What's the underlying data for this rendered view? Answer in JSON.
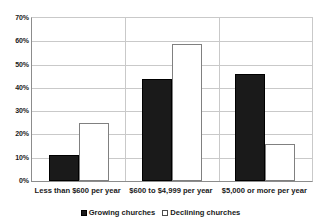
{
  "chart_data": {
    "type": "bar",
    "title": "",
    "subtitle": "",
    "xlabel": "",
    "ylabel": "",
    "categories": [
      "Less than $600 per year",
      "$600 to $4,999 per year",
      "$5,000 or more per year"
    ],
    "series": [
      {
        "name": "Growing churches",
        "color": "#1a1a1a",
        "values": [
          11,
          44,
          46
        ]
      },
      {
        "name": "Declining churches",
        "color": "#ffffff",
        "values": [
          25,
          59,
          16
        ]
      }
    ],
    "ylim": [
      0,
      70
    ],
    "ytick_values": [
      0,
      10,
      20,
      30,
      40,
      50,
      60,
      70
    ],
    "ytick_labels": [
      "0%",
      "10%",
      "20%",
      "30%",
      "40%",
      "50%",
      "60%",
      "70%"
    ],
    "grid": "horizontal",
    "legend_position": "bottom",
    "value_format": "percent"
  },
  "legend": {
    "items": [
      {
        "label": "Growing churches",
        "marker": "filled-square"
      },
      {
        "label": "Declining churches",
        "marker": "open-square"
      }
    ]
  }
}
